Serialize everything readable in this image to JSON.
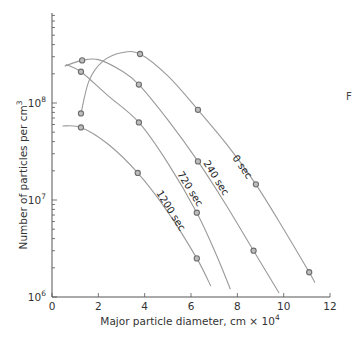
{
  "chart_data": {
    "type": "line",
    "title": "",
    "xlabel": "Major particle diameter, cm × 10",
    "xlabel_sup": "4",
    "ylabel": "Number of particles per cm",
    "ylabel_sup": "3",
    "xlim": [
      0,
      12
    ],
    "ylim": [
      1000000,
      500000000
    ],
    "yscale": "log",
    "x_ticks": [
      0,
      2,
      4,
      6,
      8,
      10,
      12
    ],
    "y_ticks": [
      {
        "base": "10",
        "exp": "6",
        "value": 1000000
      },
      {
        "base": "10",
        "exp": "7",
        "value": 10000000
      },
      {
        "base": "10",
        "exp": "8",
        "value": 100000000
      }
    ],
    "grid": false,
    "legend": "inline curve labels",
    "series": [
      {
        "name": "0 sec",
        "markers": [
          [
            1.25,
            78000000
          ],
          [
            3.8,
            320000000
          ],
          [
            6.3,
            85000000
          ],
          [
            8.8,
            14500000
          ],
          [
            11.1,
            1800000
          ]
        ],
        "curve": [
          [
            1.25,
            78000000
          ],
          [
            1.6,
            170000000
          ],
          [
            2.2,
            270000000
          ],
          [
            3.0,
            330000000
          ],
          [
            3.8,
            320000000
          ],
          [
            5.0,
            190000000
          ],
          [
            6.3,
            85000000
          ],
          [
            7.6,
            36000000
          ],
          [
            8.8,
            14500000
          ],
          [
            10.0,
            5000000
          ],
          [
            11.1,
            1800000
          ],
          [
            11.35,
            1400000
          ]
        ]
      },
      {
        "name": "240 sec",
        "markers": [
          [
            1.3,
            275000000
          ],
          [
            3.75,
            155000000
          ],
          [
            6.3,
            25000000
          ],
          [
            8.7,
            3000000
          ]
        ],
        "curve": [
          [
            0.55,
            240000000
          ],
          [
            1.3,
            275000000
          ],
          [
            2.0,
            280000000
          ],
          [
            3.0,
            215000000
          ],
          [
            3.75,
            155000000
          ],
          [
            5.0,
            67000000
          ],
          [
            6.3,
            25000000
          ],
          [
            7.5,
            9000000
          ],
          [
            8.7,
            3000000
          ],
          [
            9.8,
            1100000
          ]
        ]
      },
      {
        "name": "720 sec",
        "markers": [
          [
            1.25,
            210000000
          ],
          [
            3.75,
            63000000
          ],
          [
            6.25,
            7400000
          ]
        ],
        "curve": [
          [
            0.6,
            250000000
          ],
          [
            1.25,
            210000000
          ],
          [
            2.4,
            120000000
          ],
          [
            3.75,
            63000000
          ],
          [
            5.0,
            24000000
          ],
          [
            6.25,
            7400000
          ],
          [
            7.1,
            2700000
          ],
          [
            7.7,
            1200000
          ]
        ]
      },
      {
        "name": "1200 sec",
        "markers": [
          [
            1.25,
            56000000
          ],
          [
            3.7,
            19000000
          ],
          [
            6.25,
            2500000
          ]
        ],
        "curve": [
          [
            0.45,
            58000000
          ],
          [
            1.25,
            56000000
          ],
          [
            2.4,
            38000000
          ],
          [
            3.7,
            19000000
          ],
          [
            5.0,
            7500000
          ],
          [
            6.25,
            2500000
          ],
          [
            6.85,
            1300000
          ]
        ]
      }
    ],
    "annotations": [
      {
        "text": "F",
        "note": "partially cropped letter at right edge"
      }
    ]
  },
  "labels": {
    "curve_0": "0 sec",
    "curve_240": "240 sec",
    "curve_720": "720 sec",
    "curve_1200": "1200 sec",
    "stray": "F"
  },
  "colors": {
    "curve": "#9a9a9a",
    "marker_stroke": "#6e6e6e",
    "marker_fill": "#bdbdbd",
    "axis": "#555555"
  }
}
